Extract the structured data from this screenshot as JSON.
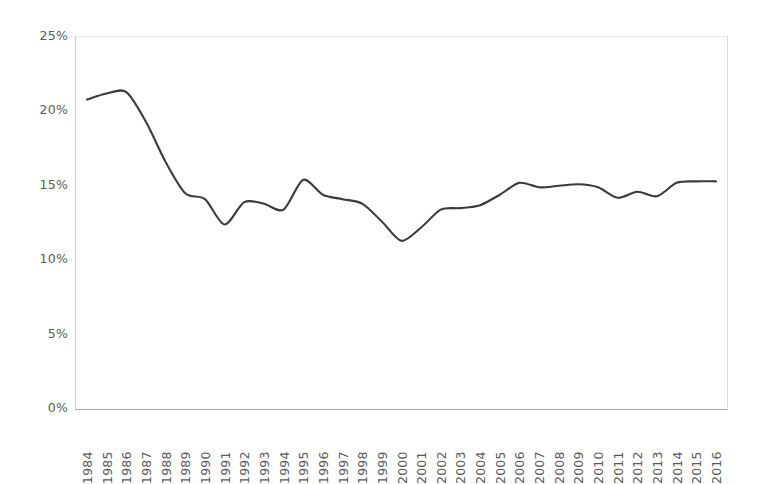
{
  "chart_data": {
    "type": "line",
    "title": "",
    "subtitle": "",
    "xlabel": "",
    "ylabel": "",
    "legend": [],
    "legend_position": "none",
    "grid": false,
    "ylim": [
      0,
      25
    ],
    "ytick_labels": [
      "25%",
      "20%",
      "15%",
      "10%",
      "5%",
      "0%"
    ],
    "ytick_values": [
      25,
      20,
      15,
      10,
      5,
      0
    ],
    "categories": [
      "1984",
      "1985",
      "1986",
      "1987",
      "1988",
      "1989",
      "1990",
      "1991",
      "1992",
      "1993",
      "1994",
      "1995",
      "1996",
      "1997",
      "1998",
      "1999",
      "2000",
      "2001",
      "2002",
      "2003",
      "2004",
      "2005",
      "2006",
      "2007",
      "2008",
      "2009",
      "2010",
      "2011",
      "2012",
      "2013",
      "2014",
      "2015",
      "2016"
    ],
    "values": [
      20.8,
      21.2,
      21.3,
      19.3,
      16.6,
      14.5,
      14.1,
      12.4,
      13.9,
      13.8,
      13.4,
      15.4,
      14.4,
      14.1,
      13.8,
      12.6,
      11.3,
      12.2,
      13.4,
      13.5,
      13.7,
      14.4,
      15.2,
      14.9,
      15.0,
      15.1,
      14.9,
      14.2,
      14.6,
      14.3,
      15.2,
      15.3,
      15.3
    ],
    "series_color": "#3a3a3a",
    "series_name": "",
    "line_width": 2.1,
    "smoothed": true,
    "markers": false
  },
  "axes": {
    "y_axis_color": "#c9c9c9",
    "x_axis_color": "#a6a6a6",
    "tick_label_color": "#5a5a5a"
  },
  "background_color": "#ffffff"
}
